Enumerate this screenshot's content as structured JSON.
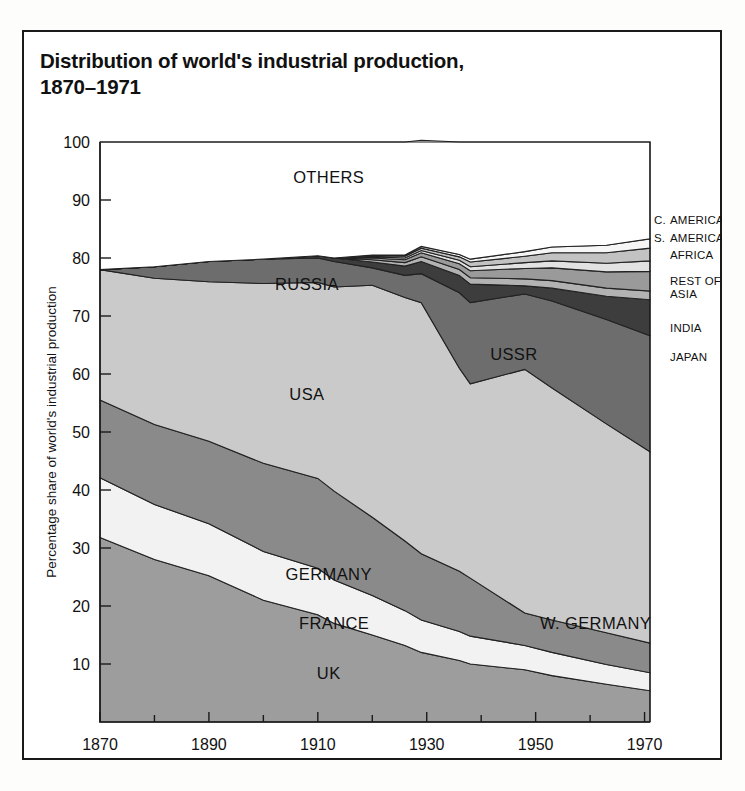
{
  "figure": {
    "title": "Distribution of world's industrial production,\n1870–1971",
    "background_color": "#fdfdfb",
    "frame_color": "#1a1a1a"
  },
  "chart_data": {
    "type": "area",
    "stacked": true,
    "xlabel": "",
    "ylabel": "Percentage share of world's industrial production",
    "xlim": [
      1870,
      1971
    ],
    "ylim": [
      0,
      100
    ],
    "grid": false,
    "legend": "inline-labels",
    "xticks": [
      1870,
      1890,
      1910,
      1930,
      1950,
      1970
    ],
    "xminorticks": [
      1880,
      1900,
      1920,
      1940,
      1960
    ],
    "yticks": [
      10,
      20,
      30,
      40,
      50,
      60,
      70,
      80,
      90,
      100
    ],
    "x": [
      1870,
      1880,
      1890,
      1900,
      1910,
      1913,
      1920,
      1926,
      1929,
      1936,
      1938,
      1948,
      1953,
      1963,
      1971
    ],
    "series": [
      {
        "name": "UK",
        "label": "UK",
        "color": "#9d9d9d",
        "values": [
          31.8,
          28.0,
          25.2,
          21.0,
          18.5,
          17.0,
          15.0,
          13.2,
          12.0,
          10.6,
          10.0,
          9.0,
          8.0,
          6.5,
          5.4
        ]
      },
      {
        "name": "FRANCE",
        "label": "FRANCE",
        "color": "#f2f2f2",
        "values": [
          10.3,
          9.5,
          9.0,
          8.4,
          8.0,
          7.5,
          6.8,
          6.0,
          5.6,
          5.0,
          4.8,
          4.2,
          4.0,
          3.4,
          3.1
        ]
      },
      {
        "name": "GERMANY",
        "label": "GERMANY",
        "color": "#8a8a8a",
        "late_label": "W. GERMANY",
        "values": [
          13.4,
          13.8,
          14.2,
          15.2,
          15.5,
          15.3,
          13.5,
          12.0,
          11.4,
          10.4,
          10.0,
          5.6,
          5.6,
          5.5,
          5.1
        ]
      },
      {
        "name": "USA",
        "label": "USA",
        "color": "#cacaca",
        "values": [
          22.5,
          25.2,
          27.5,
          31.0,
          33.8,
          35.2,
          40.0,
          42.0,
          43.3,
          35.0,
          33.5,
          42.0,
          40.0,
          36.0,
          33.0
        ]
      },
      {
        "name": "RUSSIA",
        "label": "RUSSIA",
        "color": "#6d6d6d",
        "late_label": "USSR",
        "values": [
          0.0,
          2.0,
          3.5,
          4.2,
          4.2,
          4.4,
          3.0,
          3.8,
          5.0,
          13.0,
          14.0,
          13.0,
          15.0,
          18.0,
          20.0
        ]
      },
      {
        "name": "JAPAN",
        "label": "JAPAN",
        "color": "#3d3d3d",
        "values": [
          0.0,
          0.0,
          0.0,
          0.0,
          0.4,
          0.6,
          1.0,
          1.6,
          2.1,
          3.0,
          3.2,
          1.4,
          2.2,
          4.0,
          6.2
        ]
      },
      {
        "name": "INDIA",
        "label": "INDIA",
        "color": "#b2b2b2",
        "values": [
          0.0,
          0.0,
          0.0,
          0.0,
          0.0,
          0.0,
          0.4,
          0.6,
          0.8,
          1.0,
          1.1,
          1.2,
          1.3,
          1.4,
          1.5
        ]
      },
      {
        "name": "REST OF ASIA",
        "label": "REST OF ASIA",
        "color": "#9a9a9a",
        "values": [
          0.0,
          0.0,
          0.0,
          0.0,
          0.0,
          0.0,
          0.3,
          0.5,
          0.7,
          1.0,
          1.2,
          1.8,
          2.2,
          2.8,
          3.4
        ]
      },
      {
        "name": "AFRICA",
        "label": "AFRICA",
        "color": "#e2e2e2",
        "values": [
          0.0,
          0.0,
          0.0,
          0.0,
          0.0,
          0.0,
          0.2,
          0.3,
          0.4,
          0.6,
          0.7,
          1.0,
          1.2,
          1.5,
          1.8
        ]
      },
      {
        "name": "S. AMERICA",
        "label": "S. AMERICA",
        "color": "#c2c2c2",
        "values": [
          0.0,
          0.0,
          0.0,
          0.0,
          0.0,
          0.0,
          0.2,
          0.3,
          0.4,
          0.6,
          0.8,
          1.1,
          1.4,
          1.8,
          2.2
        ]
      },
      {
        "name": "C. AMERICA",
        "label": "C. AMERICA",
        "color": "#f6f6f6",
        "values": [
          0.0,
          0.0,
          0.0,
          0.0,
          0.0,
          0.0,
          0.1,
          0.2,
          0.3,
          0.4,
          0.5,
          0.8,
          1.0,
          1.3,
          1.6
        ]
      },
      {
        "name": "OTHERS",
        "label": "OTHERS",
        "color": "#ffffff",
        "values": [
          22.0,
          21.5,
          20.6,
          20.2,
          19.6,
          20.0,
          19.5,
          19.5,
          18.3,
          19.4,
          20.2,
          18.9,
          18.1,
          17.8,
          16.7
        ]
      }
    ]
  },
  "plot_labels": [
    {
      "text": "OTHERS",
      "x": 1912,
      "y": 93.0,
      "anchor": "middle"
    },
    {
      "text": "RUSSIA",
      "x": 1908,
      "y": 74.5,
      "anchor": "middle"
    },
    {
      "text": "USA",
      "x": 1908,
      "y": 55.5,
      "anchor": "middle"
    },
    {
      "text": "USSR",
      "x": 1946,
      "y": 62.5,
      "anchor": "middle"
    },
    {
      "text": "GERMANY",
      "x": 1912,
      "y": 24.5,
      "anchor": "middle"
    },
    {
      "text": "FRANCE",
      "x": 1913,
      "y": 16.0,
      "anchor": "middle"
    },
    {
      "text": "UK",
      "x": 1912,
      "y": 7.5,
      "anchor": "middle"
    },
    {
      "text": "W. GERMANY",
      "x": 1961,
      "y": 16.0,
      "anchor": "middle"
    }
  ],
  "side_labels": [
    {
      "text": "C. AMERICA",
      "prefix": "C.",
      "y": 86.5
    },
    {
      "text": "S. AMERICA",
      "prefix": "S.",
      "y": 83.5
    },
    {
      "text": "AFRICA",
      "prefix": "",
      "y": 80.5
    },
    {
      "text": "REST OF ASIA",
      "prefix": "",
      "y": 75.0
    },
    {
      "text": "INDIA",
      "prefix": "",
      "y": 68.0
    },
    {
      "text": "JAPAN",
      "prefix": "",
      "y": 63.0
    }
  ],
  "axes": {
    "y_axis_title": "Percentage share of world's industrial production",
    "y_tick_labels": [
      "10",
      "20",
      "30",
      "40",
      "50",
      "60",
      "70",
      "80",
      "90",
      "100"
    ],
    "x_tick_labels": [
      "1870",
      "1890",
      "1910",
      "1930",
      "1950",
      "1970"
    ]
  }
}
